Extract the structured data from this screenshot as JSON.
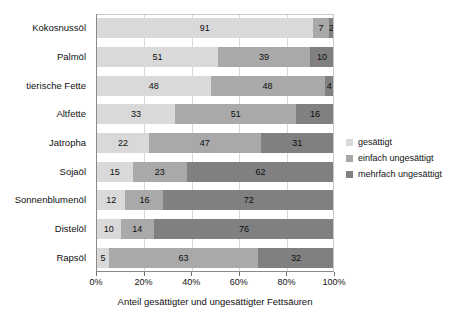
{
  "chart_data": {
    "type": "bar",
    "orientation": "horizontal",
    "stacked": true,
    "stacked_percent": true,
    "title": "",
    "xlabel": "Anteil gesättigter und ungesättigter Fettsäuren",
    "ylabel": "",
    "xlim": [
      0,
      100
    ],
    "xticks": [
      0,
      20,
      40,
      60,
      80,
      100
    ],
    "xticklabels": [
      "0%",
      "20%",
      "40%",
      "60%",
      "80%",
      "100%"
    ],
    "grid": "vertical",
    "legend_position": "right",
    "categories": [
      "Kokosnussöl",
      "Palmöl",
      "tierische Fette",
      "Altfette",
      "Jatropha",
      "Sojaöl",
      "Sonnenblumenöl",
      "Distelöl",
      "Rapsöl"
    ],
    "series": [
      {
        "name": "gesättigt",
        "color": "#d9d9d9",
        "values": [
          91,
          51,
          48,
          33,
          22,
          15,
          12,
          10,
          5
        ]
      },
      {
        "name": "einfach ungesättigt",
        "color": "#a9a9a9",
        "values": [
          7,
          39,
          48,
          51,
          47,
          23,
          16,
          14,
          63
        ]
      },
      {
        "name": "mehrfach ungesättigt",
        "color": "#808080",
        "values": [
          2,
          10,
          4,
          16,
          31,
          62,
          72,
          76,
          32
        ]
      }
    ]
  },
  "legend": {
    "items": [
      {
        "label": "gesättigt",
        "color": "#d9d9d9"
      },
      {
        "label": "einfach ungesättigt",
        "color": "#a9a9a9"
      },
      {
        "label": "mehrfach ungesättigt",
        "color": "#808080"
      }
    ]
  }
}
